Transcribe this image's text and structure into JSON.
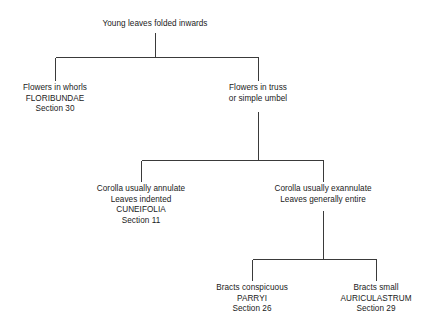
{
  "diagram": {
    "type": "taxonomic-key-tree",
    "width": 434,
    "height": 335,
    "background_color": "#ffffff",
    "line_color": "#3a3a3a",
    "text_color": "#1a1a1a"
  },
  "nodes": {
    "root": {
      "line1": "Young leaves folded inwards"
    },
    "floribundae": {
      "line1": "Flowers in whorls",
      "line2": "FLORIBUNDAE",
      "line3": "Section 30"
    },
    "truss": {
      "line1": "Flowers in truss",
      "line2": "or simple umbel"
    },
    "cuneifolia": {
      "line1": "Corolla usually annulate",
      "line2": "Leaves indented",
      "line3": "CUNEIFOLIA",
      "line4": "Section 11"
    },
    "exannulate": {
      "line1": "Corolla usually exannulate",
      "line2": "Leaves generally entire"
    },
    "parryi": {
      "line1": "Bracts conspicuous",
      "line2": "PARRYI",
      "line3": "Section 26"
    },
    "auriculastrum": {
      "line1": "Bracts small",
      "line2": "AURICULASTRUM",
      "line3": "Section 29"
    }
  }
}
